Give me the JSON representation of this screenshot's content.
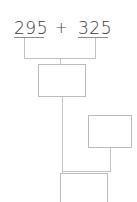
{
  "worksheet": {
    "title": "addition-decomposition-worksheet",
    "expression": {
      "addend_1": "295",
      "operator": "+",
      "addend_2": "325"
    },
    "answer_boxes": [
      {
        "name": "answer-box-1",
        "value": ""
      },
      {
        "name": "answer-box-2",
        "value": ""
      },
      {
        "name": "answer-box-3",
        "value": ""
      }
    ],
    "colors": {
      "text": "#3a3a3a",
      "line": "#c2c2c2",
      "underline": "#8e8e8e",
      "box_border": "#bcbcbc",
      "background": "#ffffff"
    }
  }
}
